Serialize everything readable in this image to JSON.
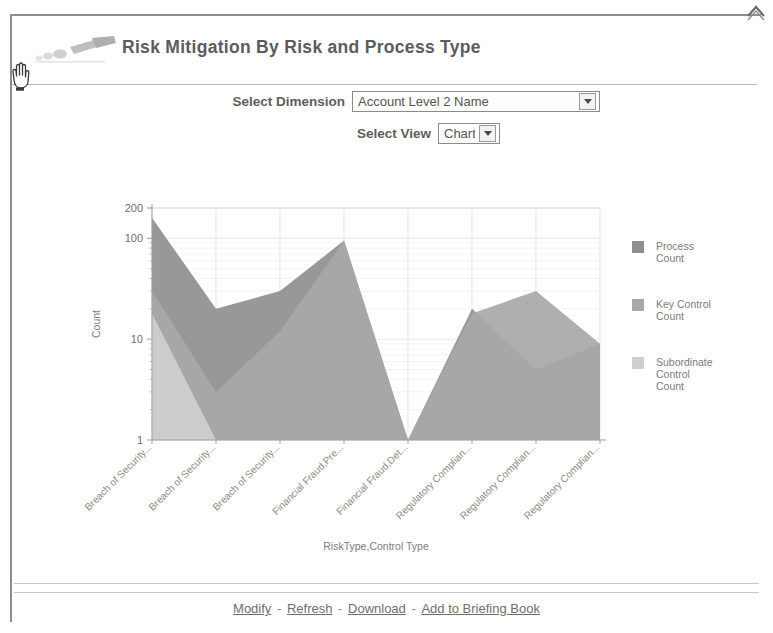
{
  "window": {
    "collapse_icon": "chevron-collapse-icon",
    "cursor_icon": "hand-cursor-icon",
    "header_icon": "brush-decoration-icon"
  },
  "header": {
    "title": "Risk Mitigation By Risk and Process Type"
  },
  "prompts": {
    "dimension": {
      "label": "Select Dimension",
      "value": "Account Level 2 Name",
      "options": [
        "Account Level 2 Name"
      ]
    },
    "view": {
      "label": "Select View",
      "value": "Chart",
      "options": [
        "Chart"
      ]
    }
  },
  "footer": {
    "links": [
      {
        "label": "Modify"
      },
      {
        "label": "Refresh"
      },
      {
        "label": "Download"
      },
      {
        "label": "Add to Briefing Book"
      }
    ],
    "separator": "-"
  },
  "colors": {
    "series_process": "#8f8f8f",
    "series_key_control": "#a8a8a8",
    "series_subordinate": "#cfcfcf",
    "grid": "#d8d8d8",
    "axis": "#a0a0a0",
    "text": "#6f6f6f"
  },
  "chart_data": {
    "type": "area",
    "title": "",
    "xlabel": "RiskType,Control Type",
    "ylabel": "Count",
    "yscale": "log",
    "ylim": [
      1,
      200
    ],
    "ytick_labels": [
      "200",
      "100",
      "10",
      "1"
    ],
    "ytick_values": [
      200,
      100,
      10,
      1
    ],
    "grid": true,
    "legend_position": "right",
    "categories": [
      "Breach of Security...",
      "Breach of Security...",
      "Breach of Security...",
      "Financial Fraud,Pre...",
      "Financial Fraud,Det...",
      "Regulatory Complian...",
      "Regulatory Complian...",
      "Regulatory Complian..."
    ],
    "series": [
      {
        "name": "Process Count",
        "color": "#8f8f8f",
        "values": [
          160,
          20,
          30,
          95,
          1,
          20,
          5,
          9
        ]
      },
      {
        "name": "Key Control Count",
        "color": "#a8a8a8",
        "values": [
          30,
          3,
          12,
          95,
          1,
          18,
          30,
          9
        ]
      },
      {
        "name": "Subordinate Control Count",
        "color": "#cfcfcf",
        "values": [
          18,
          1,
          1,
          1,
          1,
          1,
          1,
          1
        ]
      }
    ],
    "legend": [
      {
        "label_lines": [
          "Process",
          "Count"
        ],
        "swatch": "#8f8f8f"
      },
      {
        "label_lines": [
          "Key Control",
          "Count"
        ],
        "swatch": "#a8a8a8"
      },
      {
        "label_lines": [
          "Subordinate",
          "Control",
          "Count"
        ],
        "swatch": "#cfcfcf"
      }
    ]
  }
}
